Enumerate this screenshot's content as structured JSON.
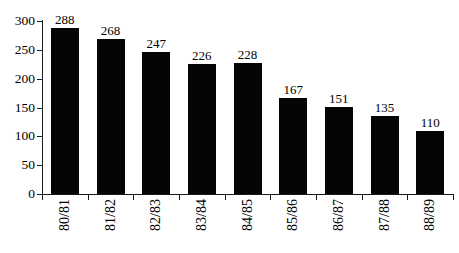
{
  "chart_data": {
    "type": "bar",
    "categories": [
      "80/81",
      "81/82",
      "82/83",
      "83/84",
      "84/85",
      "85/86",
      "86/87",
      "87/88",
      "88/89"
    ],
    "values": [
      288,
      268,
      247,
      226,
      228,
      167,
      151,
      135,
      110
    ],
    "title": "",
    "xlabel": "",
    "ylabel": "",
    "ylim": [
      0,
      300
    ],
    "y_ticks": [
      0,
      50,
      100,
      150,
      200,
      250,
      300
    ],
    "data_labels": true,
    "grid": false,
    "legend": null,
    "bar_color": "#050505",
    "background_color": "#ffffff",
    "axis_color": "#1a1a1a",
    "x_label_rotation_deg": -90
  }
}
